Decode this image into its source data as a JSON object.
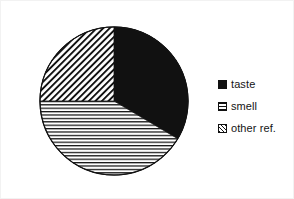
{
  "figure": {
    "background_color": "#ffffff",
    "frame_color": "#f2f2f2",
    "ink_color": "#111111"
  },
  "legend": {
    "position": "right",
    "entries": [
      {
        "label": "taste",
        "swatch": "solid-black-swatch-icon",
        "pattern": "solid",
        "color": "#111111"
      },
      {
        "label": "smell",
        "swatch": "horizontal-hatch-swatch-icon",
        "pattern": "horizontal",
        "color": "#111111"
      },
      {
        "label": "other ref.",
        "swatch": "diagonal-hatch-swatch-icon",
        "pattern": "diagonal",
        "color": "#111111"
      }
    ]
  },
  "chart_data": {
    "type": "pie",
    "title": "",
    "subtitle": "",
    "xlabel": "",
    "ylabel": "",
    "labels": [
      "taste",
      "smell",
      "other ref."
    ],
    "values": [
      33.5,
      41.5,
      25.0
    ],
    "units": "percent",
    "start_angle_deg": 0,
    "direction": "clockwise",
    "slices": [
      {
        "label": "taste",
        "value": 33.5,
        "pattern": "solid",
        "color": "#111111",
        "start_angle_deg": 0,
        "end_angle_deg": 120.6
      },
      {
        "label": "smell",
        "value": 41.5,
        "pattern": "horizontal",
        "color": "#111111",
        "start_angle_deg": 120.6,
        "end_angle_deg": 270.0
      },
      {
        "label": "other ref.",
        "value": 25.0,
        "pattern": "diagonal",
        "color": "#111111",
        "start_angle_deg": 270.0,
        "end_angle_deg": 360.0
      }
    ],
    "legend": [
      "taste",
      "smell",
      "other ref."
    ],
    "legend_position": "right",
    "grid": false,
    "data_labels_shown": false
  }
}
